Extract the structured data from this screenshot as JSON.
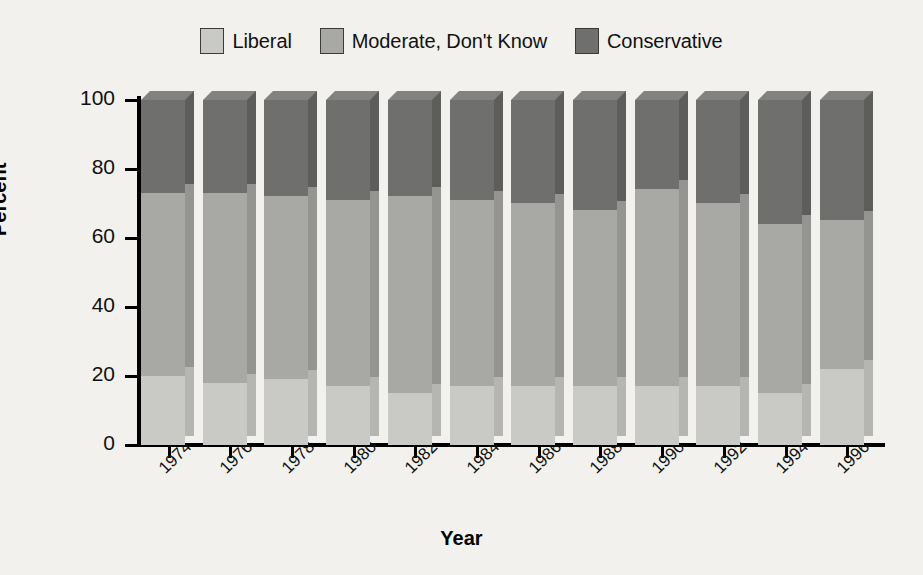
{
  "legend": {
    "items": [
      {
        "label": "Liberal",
        "color": "#c9c9c6"
      },
      {
        "label": "Moderate, Don't Know",
        "color": "#a8a8a5"
      },
      {
        "label": "Conservative",
        "color": "#6f6f6e"
      }
    ]
  },
  "axes": {
    "ylabel": "Percent",
    "xlabel": "Year",
    "yticks": [
      "0",
      "20",
      "40",
      "60",
      "80",
      "100"
    ]
  },
  "chart_data": {
    "type": "bar",
    "title": "",
    "subtitle": "",
    "xlabel": "Year",
    "ylabel": "Percent",
    "ylim": [
      0,
      100
    ],
    "yticks": [
      0,
      20,
      40,
      60,
      80,
      100
    ],
    "grid": false,
    "stacked": true,
    "three_d": true,
    "legend_position": "top-center",
    "categories": [
      "1974",
      "1976",
      "1978",
      "1980",
      "1982",
      "1984",
      "1986",
      "1988",
      "1990",
      "1992",
      "1994",
      "1996"
    ],
    "series": [
      {
        "name": "Liberal",
        "color": "#c9c9c6",
        "values": [
          20,
          18,
          19,
          17,
          15,
          17,
          17,
          17,
          17,
          17,
          15,
          22
        ]
      },
      {
        "name": "Moderate, Don't Know",
        "color": "#a8a8a5",
        "values": [
          53,
          55,
          53,
          54,
          57,
          54,
          53,
          51,
          57,
          53,
          49,
          43
        ]
      },
      {
        "name": "Conservative",
        "color": "#6f6f6e",
        "values": [
          27,
          27,
          28,
          29,
          28,
          29,
          30,
          32,
          26,
          30,
          36,
          35
        ]
      }
    ],
    "cumulative_tops": {
      "liberal": [
        20,
        18,
        19,
        17,
        15,
        17,
        17,
        17,
        17,
        17,
        15,
        22
      ],
      "moderate": [
        73,
        73,
        72,
        71,
        72,
        71,
        70,
        68,
        74,
        70,
        64,
        65
      ],
      "total": [
        100,
        100,
        100,
        100,
        100,
        100,
        100,
        100,
        100,
        100,
        100,
        100
      ]
    }
  },
  "colors": {
    "background": "#f2f1ee",
    "liberal_front": "#c9c9c6",
    "liberal_side": "#b5b5b2",
    "liberal_top": "#d8d8d5",
    "moderate_front": "#a8a8a5",
    "moderate_side": "#949492",
    "moderate_top": "#b8b8b5",
    "conservative_front": "#6f6f6e",
    "conservative_side": "#5d5d5c",
    "conservative_top": "#828281",
    "axis": "#000000"
  }
}
